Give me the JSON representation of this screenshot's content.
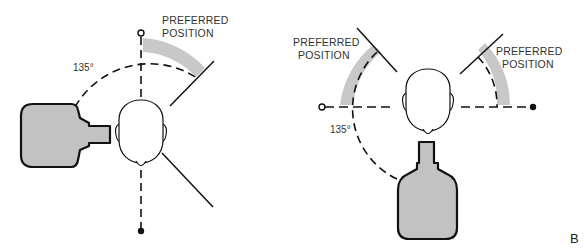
{
  "colors": {
    "line": "#111111",
    "bottle_fill": "#c2c2c2",
    "preferred_band": "#c8c8c8",
    "background": "#ffffff",
    "text": "#333333"
  },
  "panel_a": {
    "label_preferred_line1": "PREFERRED",
    "label_preferred_line2": "POSITION",
    "angle_label": "135°",
    "elements": [
      "head-top-view",
      "bottle-left",
      "vertical-axis-line",
      "open-circle-marker",
      "filled-dot-marker",
      "dashed-arc-135",
      "preferred-position-band",
      "tick-line",
      "diagonal-line"
    ]
  },
  "panel_b": {
    "left_label_line1": "PREFERRED",
    "left_label_line2": "POSITION",
    "right_label_line1": "PREFERRED",
    "right_label_line2": "POSITION",
    "angle_label": "135°",
    "panel_letter": "B",
    "elements": [
      "head-top-view",
      "bottle-below",
      "horizontal-axis-line",
      "open-circle-marker",
      "filled-dot-marker",
      "dashed-arc-135",
      "left-preferred-band",
      "right-preferred-band",
      "left-tick-line",
      "right-tick-line"
    ]
  }
}
